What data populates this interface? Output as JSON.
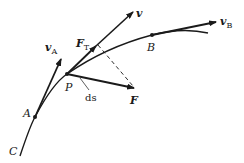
{
  "diagram": {
    "colors": {
      "stroke": "#1a1a1a",
      "background": "#ffffff"
    },
    "points": {
      "C": {
        "label": "C"
      },
      "A": {
        "label": "A"
      },
      "P": {
        "label": "P"
      },
      "B": {
        "label": "B"
      }
    },
    "vectors": {
      "vA": {
        "symbol": "v",
        "subscript": "A"
      },
      "v": {
        "symbol": "v",
        "subscript": ""
      },
      "vB": {
        "symbol": "v",
        "subscript": "B"
      },
      "FT": {
        "symbol": "F",
        "subscript": "T"
      },
      "F": {
        "symbol": "F",
        "subscript": ""
      }
    },
    "annotations": {
      "ds": "ds"
    }
  }
}
